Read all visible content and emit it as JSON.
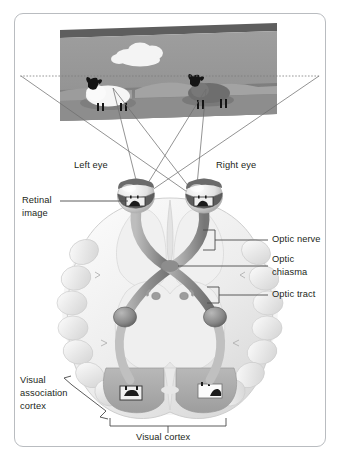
{
  "figure": {
    "title_alt": "Visual pathway from eyes to visual cortex",
    "border_color": "#b9bcc0",
    "background": "#ffffff"
  },
  "scene_panel": {
    "name": "external-visual-scene",
    "face_color": "#9a9a9a",
    "top_edge_color": "#5e5e5e",
    "ground_color": "#8b8b8b",
    "hill_color": "#a6a6a6",
    "objects": [
      {
        "name": "cloud",
        "color": "#f2f2f2"
      },
      {
        "name": "white-sheep",
        "body_color": "#f4f4f4",
        "head_color": "#1a1a1a",
        "position": "left"
      },
      {
        "name": "dark-sheep",
        "body_color": "#6a6a6a",
        "head_color": "#1a1a1a",
        "position": "right"
      },
      {
        "name": "horizon-dotted-line",
        "color": "#808080"
      }
    ]
  },
  "sight_lines": {
    "name": "light-ray-projection-lines",
    "color": "#6f6f6f",
    "description": "Crossing rays from the scene edges to each eye"
  },
  "labels": {
    "left_eye": "Left eye",
    "right_eye": "Right eye",
    "retinal_image_line1": "Retinal",
    "retinal_image_line2": "image",
    "optic_nerve": "Optic nerve",
    "optic_chiasma_line1": "Optic",
    "optic_chiasma_line2": "chiasma",
    "optic_tract": "Optic tract",
    "visual_association_line1": "Visual",
    "visual_association_line2": "association",
    "visual_association_line3": "cortex",
    "visual_cortex": "Visual cortex"
  },
  "anatomy": {
    "brain_fill": "#f3f3f3",
    "brain_shade": "#d8d8d8",
    "pathway_fill": "#9a9a9a",
    "pathway_dark": "#6e6e6e",
    "eye_fill": "#e8e8e8",
    "eye_band": "#5a5a5a",
    "geniculate_fill": "#8a8a8a",
    "parts": [
      "left-eye",
      "right-eye",
      "retina",
      "optic-nerve",
      "optic-chiasma",
      "optic-tract",
      "lateral-geniculate-body",
      "optic-radiation",
      "visual-cortex",
      "visual-association-cortex"
    ]
  },
  "cortex_images": {
    "left_hemisphere_image": "inverted-dark-sheep",
    "right_hemisphere_image": "inverted-white-sheep"
  },
  "leader_lines": {
    "color": "#4a4a4a",
    "bracket_color": "#4a4a4a"
  }
}
